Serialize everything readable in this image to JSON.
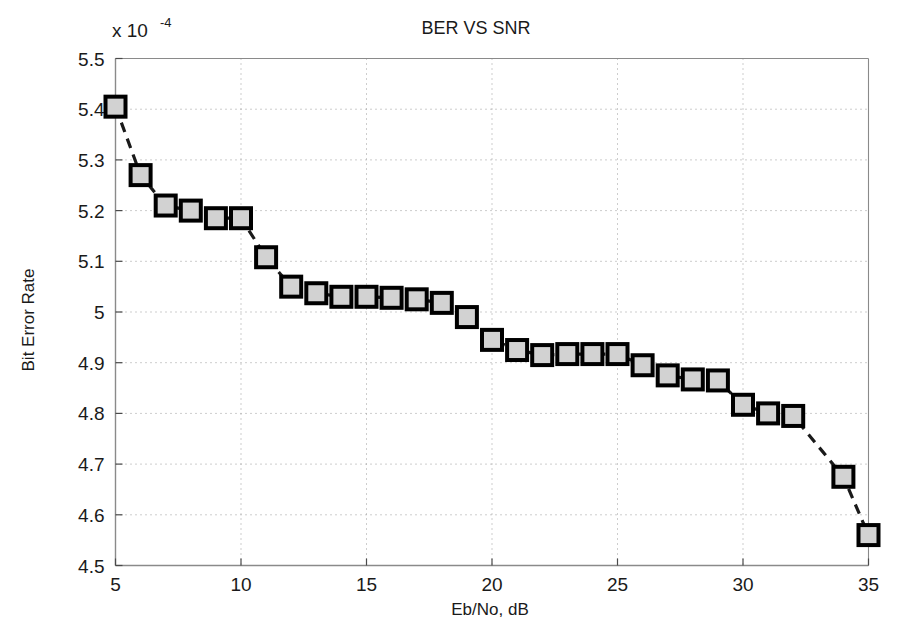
{
  "chart_data": {
    "type": "line",
    "title": "BER VS SNR",
    "xlabel": "Eb/No, dB",
    "ylabel": "Bit Error Rate",
    "y_multiplier_label": "x 10",
    "y_multiplier_exponent": "-4",
    "y_scale_factor": 0.0001,
    "xlim": [
      5,
      35
    ],
    "ylim": [
      4.5,
      5.5
    ],
    "xticks": [
      5,
      10,
      15,
      20,
      25,
      30,
      35
    ],
    "xticklabels": [
      "5",
      "10",
      "15",
      "20",
      "25",
      "30",
      "35"
    ],
    "yticks": [
      4.5,
      4.6,
      4.7,
      4.8,
      4.9,
      5.0,
      5.1,
      5.2,
      5.3,
      5.4,
      5.5
    ],
    "yticklabels": [
      "4.5",
      "4.6",
      "4.7",
      "4.8",
      "4.9",
      "5",
      "5.1",
      "5.2",
      "5.3",
      "5.4",
      "5.5"
    ],
    "grid": true,
    "legend": null,
    "marker": "square",
    "marker_facecolor": "#d2d2d2",
    "marker_edgecolor": "#000000",
    "line_style": "dashed",
    "line_color": "#1a1a1a",
    "x": [
      5,
      6,
      7,
      8,
      9,
      10,
      11,
      12,
      13,
      14,
      15,
      16,
      17,
      18,
      19,
      20,
      21,
      22,
      23,
      24,
      25,
      26,
      27,
      28,
      29,
      30,
      31,
      32,
      34,
      35
    ],
    "values": [
      5.405,
      5.27,
      5.21,
      5.2,
      5.185,
      5.185,
      5.108,
      5.05,
      5.037,
      5.03,
      5.03,
      5.028,
      5.025,
      5.018,
      4.99,
      4.945,
      4.925,
      4.915,
      4.917,
      4.917,
      4.917,
      4.895,
      4.875,
      4.867,
      4.865,
      4.817,
      4.8,
      4.795,
      4.675,
      4.56
    ]
  },
  "axes": {
    "title_name": "BER VS SNR"
  }
}
